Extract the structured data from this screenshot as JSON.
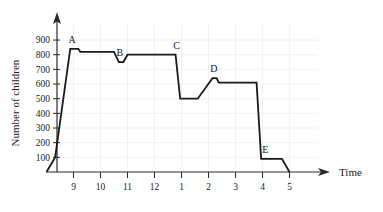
{
  "chart_data": {
    "type": "line",
    "title": "",
    "xlabel": "Time",
    "ylabel": "Number of children",
    "grid": true,
    "legend": "none",
    "xlim": [
      8,
      5.4
    ],
    "ylim": [
      0,
      950
    ],
    "y_ticks": [
      100,
      200,
      300,
      400,
      500,
      600,
      700,
      800,
      900
    ],
    "x_ticks": [
      "9",
      "10",
      "11",
      "12",
      "1",
      "2",
      "3",
      "4",
      "5"
    ],
    "x_tick_values": [
      9,
      10,
      11,
      12,
      13,
      14,
      15,
      16,
      17
    ],
    "series": [
      {
        "name": "children",
        "points": [
          {
            "x": 8.0,
            "y": 0
          },
          {
            "x": 8.32,
            "y": 100
          },
          {
            "x": 8.88,
            "y": 840
          },
          {
            "x": 9.18,
            "y": 840
          },
          {
            "x": 9.25,
            "y": 820
          },
          {
            "x": 10.5,
            "y": 820
          },
          {
            "x": 10.68,
            "y": 750
          },
          {
            "x": 10.85,
            "y": 750
          },
          {
            "x": 11.0,
            "y": 800
          },
          {
            "x": 12.78,
            "y": 800
          },
          {
            "x": 12.95,
            "y": 500
          },
          {
            "x": 13.6,
            "y": 500
          },
          {
            "x": 14.15,
            "y": 640
          },
          {
            "x": 14.3,
            "y": 640
          },
          {
            "x": 14.38,
            "y": 610
          },
          {
            "x": 15.78,
            "y": 610
          },
          {
            "x": 15.95,
            "y": 90
          },
          {
            "x": 16.72,
            "y": 90
          },
          {
            "x": 17.0,
            "y": 0
          }
        ]
      }
    ],
    "annotations": [
      {
        "label": "A",
        "x": 8.95,
        "y": 840,
        "note": "first peak"
      },
      {
        "label": "B",
        "x": 10.72,
        "y": 750,
        "note": "dip"
      },
      {
        "label": "C",
        "x": 12.82,
        "y": 800,
        "note": "start of big drop"
      },
      {
        "label": "D",
        "x": 14.2,
        "y": 640,
        "note": "second peak"
      },
      {
        "label": "E",
        "x": 16.1,
        "y": 90,
        "note": "low plateau"
      }
    ]
  },
  "axes": {
    "y_axis_title": "Number of children",
    "x_axis_title": "Time",
    "y_tick_labels": [
      "900",
      "800",
      "700",
      "600",
      "500",
      "400",
      "300",
      "200",
      "100"
    ],
    "x_tick_labels": [
      "9",
      "10",
      "11",
      "12",
      "1",
      "2",
      "3",
      "4",
      "5"
    ]
  },
  "point_labels": [
    "A",
    "B",
    "C",
    "D",
    "E"
  ],
  "colors": {
    "line": "#1a1a1a",
    "axis": "#2a2a2a",
    "grid": "#ececec",
    "background": "#ffffff",
    "text": "#1a1a1a"
  }
}
